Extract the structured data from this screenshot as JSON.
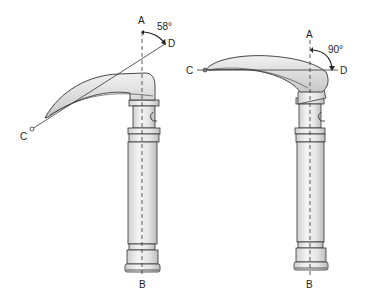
{
  "diagram": {
    "left": {
      "labels": {
        "A": "A",
        "B": "B",
        "C": "C",
        "D": "D"
      },
      "angle": "58°"
    },
    "right": {
      "labels": {
        "A": "A",
        "B": "B",
        "C": "C",
        "D": "D"
      },
      "angle": "90°"
    }
  },
  "colors": {
    "stroke": "#333333",
    "fill_light": "#ececec",
    "fill_mid": "#d8d8d8",
    "fill_dark": "#bcbcbc"
  }
}
